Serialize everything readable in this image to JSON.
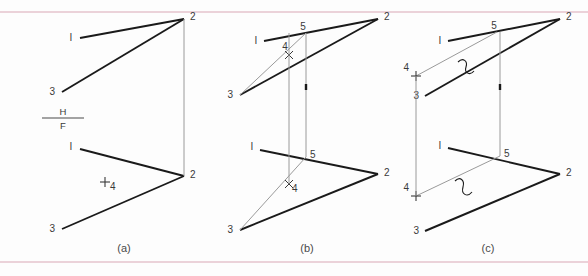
{
  "figure": {
    "background_color": "#fdfdfd",
    "rule_color": "#d9a8b6",
    "line_color": "#1a1a1a",
    "thin_line_color": "#8d8d8d",
    "label_color": "#3a3a3a",
    "width": 588,
    "height": 276
  },
  "captions": {
    "a": "(a)",
    "b": "(b)",
    "c": "(c)"
  },
  "foldline": {
    "top_label": "H",
    "bottom_label": "F"
  },
  "panels": {
    "a": {
      "caption": "(a)",
      "top_view": {
        "labels": {
          "p1": "I",
          "p2": "2",
          "p3": "3"
        }
      },
      "front_view": {
        "labels": {
          "p1": "I",
          "p2": "2",
          "p3": "3",
          "p4": "4"
        }
      }
    },
    "b": {
      "caption": "(b)",
      "top_view": {
        "labels": {
          "p1": "I",
          "p2": "2",
          "p3": "3",
          "p4": "4",
          "p5": "5"
        }
      },
      "front_view": {
        "labels": {
          "p1": "I",
          "p2": "2",
          "p3": "3",
          "p4": "4",
          "p5": "5"
        }
      }
    },
    "c": {
      "caption": "(c)",
      "top_view": {
        "labels": {
          "p1": "I",
          "p2": "2",
          "p3": "3",
          "p4": "4",
          "p5": "5"
        }
      },
      "front_view": {
        "labels": {
          "p1": "I",
          "p2": "2",
          "p3": "3",
          "p4": "4",
          "p5": "5"
        }
      }
    }
  }
}
